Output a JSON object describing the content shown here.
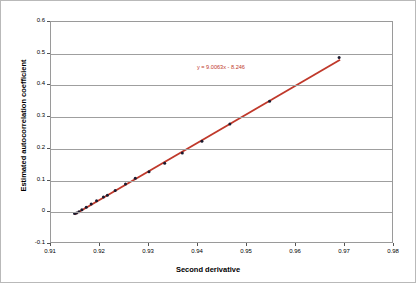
{
  "chart_data": {
    "type": "scatter",
    "title": "",
    "xlabel": "Second derivative",
    "ylabel": "Estimated autocorrelation coefficient",
    "xlim": [
      0.91,
      0.98
    ],
    "ylim": [
      -0.1,
      0.6
    ],
    "xticks": [
      "0.91",
      "0.92",
      "0.93",
      "0.94",
      "0.95",
      "0.96",
      "0.97",
      "0.98"
    ],
    "xtick_values": [
      0.91,
      0.92,
      0.93,
      0.94,
      0.95,
      0.96,
      0.97,
      0.98
    ],
    "yticks": [
      "0.6",
      "0.5",
      "0.4",
      "0.3",
      "0.2",
      "0.1",
      "0",
      "-0.1"
    ],
    "ytick_values": [
      0.6,
      0.5,
      0.4,
      0.3,
      0.2,
      0.1,
      0,
      -0.1
    ],
    "grid": "horizontal",
    "legend": "none",
    "marker_color": "#1a1a2e",
    "trendline_color": "#c0392b",
    "gridline_color": "#9f9f9f",
    "annotations": [
      {
        "name": "trendline-equation",
        "text": "y = 9.0063x - 8.246",
        "x": 0.9455,
        "y": 0.455,
        "color": "#c0392b"
      }
    ],
    "trendline": {
      "slope": 9.0063,
      "intercept": -8.246,
      "x_start": 0.9148,
      "x_end": 0.969
    },
    "series": [
      {
        "name": "Estimated autocorrelation coefficient",
        "x": [
          0.9148,
          0.9152,
          0.9157,
          0.9163,
          0.9172,
          0.9182,
          0.9193,
          0.9207,
          0.9215,
          0.9231,
          0.9252,
          0.9272,
          0.93,
          0.9332,
          0.9368,
          0.9408,
          0.9465,
          0.9546,
          0.9688
        ],
        "y": [
          -0.004,
          -0.002,
          0.002,
          0.008,
          0.016,
          0.026,
          0.036,
          0.048,
          0.054,
          0.069,
          0.089,
          0.107,
          0.128,
          0.155,
          0.187,
          0.224,
          0.278,
          0.35,
          0.488
        ]
      }
    ]
  }
}
